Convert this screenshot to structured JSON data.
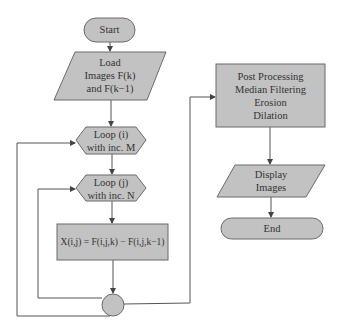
{
  "diagram": {
    "type": "flowchart",
    "colors": {
      "fill": "#c2c2c2",
      "stroke": "#6b6b6b",
      "text": "#333333",
      "line": "#555555"
    },
    "nodes": {
      "start": {
        "label": "Start",
        "shape": "terminator"
      },
      "load": {
        "lines": [
          "Load",
          "Images F(k)",
          "and F(k−1)"
        ],
        "shape": "parallelogram"
      },
      "loop_i": {
        "lines": [
          "Loop (i)",
          "with inc. M"
        ],
        "shape": "hexagon"
      },
      "loop_j": {
        "lines": [
          "Loop (j)",
          "with inc. N"
        ],
        "shape": "hexagon"
      },
      "compute": {
        "label": "X(i,j) = F(i,j,k) − F(i,j,k−1)",
        "shape": "process"
      },
      "connector": {
        "label": "",
        "shape": "connector"
      },
      "post": {
        "lines": [
          "Post Processing",
          "Median Filtering",
          "Erosion",
          "Dilation"
        ],
        "shape": "process"
      },
      "display": {
        "lines": [
          "Display",
          "Images"
        ],
        "shape": "parallelogram"
      },
      "end": {
        "label": "End",
        "shape": "terminator"
      }
    },
    "edges": [
      [
        "start",
        "load"
      ],
      [
        "load",
        "loop_i"
      ],
      [
        "loop_i",
        "loop_j"
      ],
      [
        "loop_j",
        "compute"
      ],
      [
        "compute",
        "connector"
      ],
      [
        "connector",
        "loop_j"
      ],
      [
        "connector",
        "loop_i"
      ],
      [
        "connector",
        "post"
      ],
      [
        "post",
        "display"
      ],
      [
        "display",
        "end"
      ]
    ]
  }
}
